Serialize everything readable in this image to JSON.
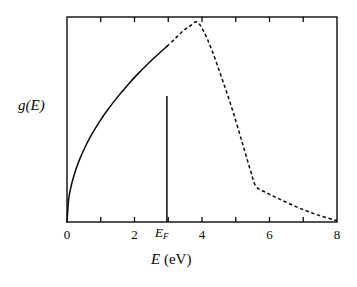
{
  "figure": {
    "background_color": "#ffffff",
    "line_color": "#0a0a0a",
    "frame": {
      "left": 67,
      "right": 337,
      "top": 17,
      "bottom": 222
    }
  },
  "labels": {
    "ylabel": "g(E)",
    "xlabel_symbol": "E",
    "xlabel_units": "(eV)",
    "fermi_symbol": "E",
    "fermi_subscript": "F"
  },
  "chart_data": {
    "type": "line",
    "title": "",
    "xlabel": "E (eV)",
    "ylabel": "g(E)",
    "xlim": [
      0,
      8
    ],
    "ylim": [
      0,
      1.15
    ],
    "grid": false,
    "legend": false,
    "x_ticks": [
      0,
      1,
      2,
      3,
      4,
      5,
      6,
      7,
      8
    ],
    "x_tick_labels": [
      "0",
      "",
      "2",
      "",
      "4",
      "",
      "6",
      "",
      "8"
    ],
    "y_ticks": [],
    "y_tick_labels": [],
    "annotations": [
      {
        "name": "fermi-level-line",
        "text": "E_F",
        "x": 2.96,
        "y_from": 0,
        "y_to": 0.7073,
        "style": "vertical-solid-line"
      }
    ],
    "series": [
      {
        "name": "occupied-states",
        "style": "solid",
        "description": "Square-root density of states up to the Fermi energy",
        "x": [
          0.0,
          0.05,
          0.12,
          0.22,
          0.35,
          0.52,
          0.72,
          0.95,
          1.2,
          1.5,
          1.8,
          2.1,
          2.4,
          2.7,
          2.96
        ],
        "y": [
          0.0,
          0.128,
          0.199,
          0.269,
          0.34,
          0.414,
          0.487,
          0.559,
          0.628,
          0.702,
          0.769,
          0.831,
          0.888,
          0.941,
          0.9852
        ]
      },
      {
        "name": "unoccupied-states",
        "style": "dashed",
        "description": "Continuation beyond the Fermi energy: peak then steep fall with a long tail",
        "x": [
          2.96,
          3.2,
          3.45,
          3.65,
          3.85,
          4.05,
          4.3,
          4.6,
          4.9,
          5.2,
          5.45,
          5.6,
          5.9,
          6.3,
          6.8,
          7.3,
          7.8,
          8.0
        ],
        "y": [
          0.9852,
          1.028,
          1.073,
          1.1,
          1.122,
          1.07,
          0.96,
          0.8,
          0.63,
          0.44,
          0.28,
          0.2,
          0.165,
          0.128,
          0.085,
          0.048,
          0.018,
          0.008
        ]
      }
    ]
  }
}
